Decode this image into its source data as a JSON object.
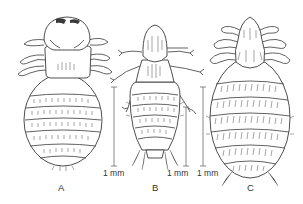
{
  "figure": {
    "type": "scientific-illustration",
    "ink_color": "#3a3a3a",
    "background": "#ffffff"
  },
  "panels": [
    {
      "id": "A",
      "label": "A",
      "scale_label": "1 mm"
    },
    {
      "id": "B",
      "label": "B",
      "scale_label": "1 mm"
    },
    {
      "id": "C",
      "label": "C",
      "scale_label": "1 mm"
    }
  ],
  "scale_bars": [
    {
      "label": "1 mm",
      "x": 114,
      "y_top": 87,
      "y_bottom": 166
    },
    {
      "label": "1 mm",
      "x": 186,
      "y_top": 107,
      "y_bottom": 166
    },
    {
      "label": "1 mm",
      "x": 203,
      "y_top": 87,
      "y_bottom": 166
    }
  ]
}
